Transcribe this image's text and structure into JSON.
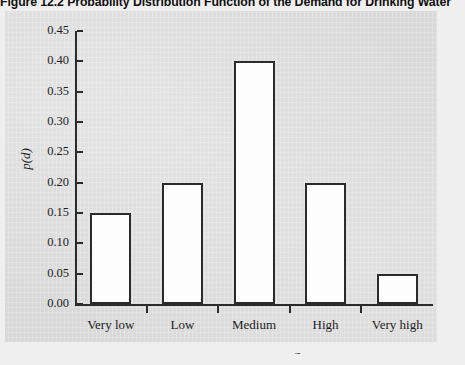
{
  "figure": {
    "caption": "Figure 12.2  Probability Distribution Function of the Demand for Drinking Water"
  },
  "colors": {
    "page_background": "#efefef",
    "panel_background": "#d8d8d8",
    "axis": "#2b2b2b",
    "bar_fill": "#fdfdfd",
    "bar_outline": "#2b2b2b",
    "text": "#1c1c1c"
  },
  "axis_titles": {
    "y": "p(d)",
    "x_italic": "D",
    "x_rest": ", demand for drinking water"
  },
  "chart_data": {
    "type": "bar",
    "title": "Figure 12.2  Probability Distribution Function of the Demand for Drinking Water",
    "categories": [
      "Very low",
      "Low",
      "Medium",
      "High",
      "Very high"
    ],
    "values": [
      0.15,
      0.2,
      0.4,
      0.2,
      0.05
    ],
    "series": [
      {
        "name": "p(d)",
        "values": [
          0.15,
          0.2,
          0.4,
          0.2,
          0.05
        ]
      }
    ],
    "xlabel": "D, demand for drinking water",
    "ylabel": "p(d)",
    "ylim": [
      0.0,
      0.45
    ],
    "yticks": [
      "0.00",
      "0.05",
      "0.10",
      "0.15",
      "0.20",
      "0.25",
      "0.30",
      "0.35",
      "0.40",
      "0.45"
    ],
    "ytick_values": [
      0.0,
      0.05,
      0.1,
      0.15,
      0.2,
      0.25,
      0.3,
      0.35,
      0.4,
      0.45
    ],
    "grid": false,
    "legend": "none"
  }
}
